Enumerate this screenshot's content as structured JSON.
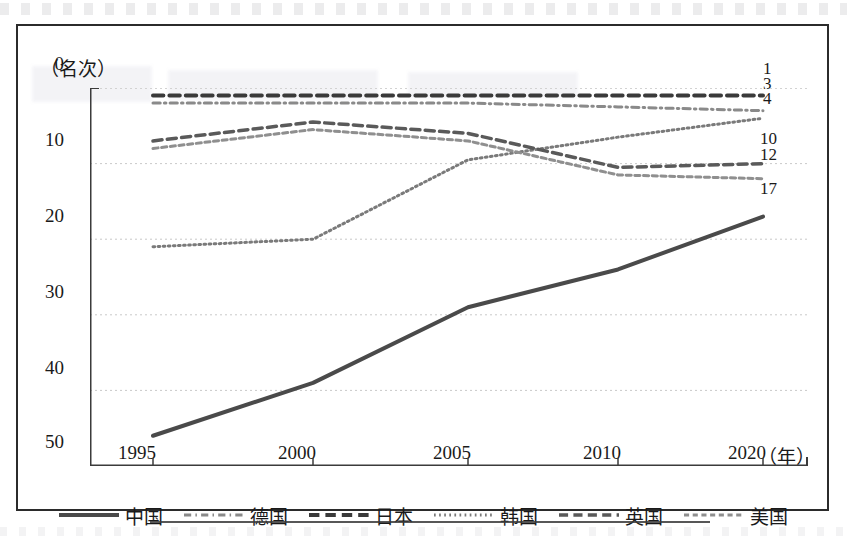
{
  "figure": {
    "y_axis_unit": "（名次）",
    "x_axis_unit": "（年）"
  },
  "chart_data": {
    "type": "line",
    "title": "",
    "subtitle": "",
    "xlabel": "（年）",
    "ylabel": "（名次）",
    "x": [
      "1995",
      "2000",
      "2005",
      "2010",
      "2020"
    ],
    "categories": [
      "1995",
      "2000",
      "2005",
      "2010",
      "2020"
    ],
    "xtick_labels": [
      "1995",
      "2000",
      "2005",
      "2010",
      "2020"
    ],
    "ytick_labels": [
      "0",
      "10",
      "20",
      "30",
      "40",
      "50"
    ],
    "ytick_values": [
      0,
      10,
      20,
      30,
      40,
      50
    ],
    "ylim": [
      0,
      50
    ],
    "y_inverted": true,
    "grid": true,
    "grid_axis": "y",
    "legend_position": "bottom",
    "note": "Y axis is rank (名次); smaller value = better rank, axis runs 0 at top to 50 at bottom.",
    "series": [
      {
        "name": "中国",
        "style": "solid",
        "color": "#4a4a4a",
        "width": 4,
        "values": [
          46,
          39,
          29,
          24,
          17
        ],
        "end_label": "17"
      },
      {
        "name": "德国",
        "style": "dashdot",
        "color": "#8a8a8a",
        "width": 3,
        "values": [
          2,
          2,
          2,
          2.5,
          3
        ],
        "end_label": "3"
      },
      {
        "name": "日本",
        "style": "dash",
        "color": "#3a3a3a",
        "width": 4,
        "values": [
          1,
          1,
          1,
          1,
          1
        ],
        "end_label": "1"
      },
      {
        "name": "韩国",
        "style": "dot",
        "color": "#7a7a7a",
        "width": 3,
        "values": [
          21,
          20,
          9.5,
          6.5,
          4
        ],
        "end_label": "4"
      },
      {
        "name": "英国",
        "style": "dash",
        "color": "#5a5a5a",
        "width": 3.5,
        "values": [
          7,
          4.5,
          6,
          10.5,
          10
        ],
        "end_label": "10"
      },
      {
        "name": "美国",
        "style": "finedash",
        "color": "#8f8f8f",
        "width": 3,
        "values": [
          8,
          5.5,
          7,
          11.5,
          12
        ],
        "end_label": "12"
      }
    ]
  },
  "legend": {
    "items": [
      {
        "label": "中国",
        "style": "solid"
      },
      {
        "label": "德国",
        "style": "dashdot"
      },
      {
        "label": "日本",
        "style": "dash"
      },
      {
        "label": "韩国",
        "style": "dot"
      },
      {
        "label": "英国",
        "style": "dash"
      },
      {
        "label": "美国",
        "style": "finedash"
      }
    ]
  }
}
